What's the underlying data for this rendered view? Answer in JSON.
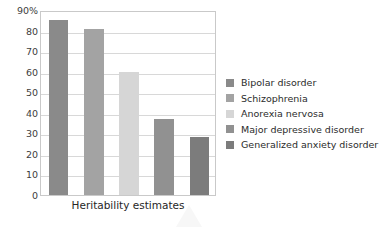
{
  "chart_data": {
    "type": "bar",
    "title": "",
    "xlabel": "Heritability estimates",
    "ylabel": "",
    "categories": [
      "Bipolar disorder",
      "Schizophrenia",
      "Anorexia nervosa",
      "Major depressive disorder",
      "Generalized anxiety disorder"
    ],
    "values": [
      85,
      81,
      60,
      37,
      28
    ],
    "ylim": [
      0,
      90
    ],
    "ytick_labels": [
      "90%",
      "80",
      "70",
      "60",
      "50",
      "40",
      "30",
      "20",
      "10",
      "0"
    ],
    "ytick_values": [
      90,
      80,
      70,
      60,
      50,
      40,
      30,
      20,
      10,
      0
    ],
    "grid": true,
    "legend_position": "right",
    "colors": [
      "#8a8a8a",
      "#a3a3a3",
      "#d6d6d6",
      "#919191",
      "#7c7c7c"
    ],
    "axis_color": "#c9c9c9",
    "grid_color": "#d8d8d8"
  },
  "legend": {
    "entries": [
      {
        "label": "Bipolar disorder",
        "color": "#8a8a8a"
      },
      {
        "label": "Schizophrenia",
        "color": "#a3a3a3"
      },
      {
        "label": "Anorexia nervosa",
        "color": "#d6d6d6"
      },
      {
        "label": "Major depressive disorder",
        "color": "#919191"
      },
      {
        "label": "Generalized anxiety disorder",
        "color": "#7c7c7c"
      }
    ]
  }
}
